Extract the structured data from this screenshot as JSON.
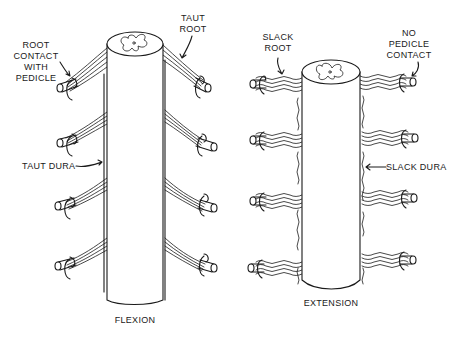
{
  "figure": {
    "panels": [
      {
        "id": "flexion",
        "caption": "FLEXION",
        "labels": {
          "root_contact": "ROOT\nCONTACT\nWITH\nPEDICLE",
          "taut_root": "TAUT\nROOT",
          "taut_dura": "TAUT DURA"
        }
      },
      {
        "id": "extension",
        "caption": "EXTENSION",
        "labels": {
          "slack_root": "SLACK\nROOT",
          "no_pedicle": "NO\nPEDICLE\nCONTACT",
          "slack_dura": "SLACK DURA"
        }
      }
    ],
    "colors": {
      "ink": "#1a1a1a",
      "background": "#ffffff"
    }
  }
}
